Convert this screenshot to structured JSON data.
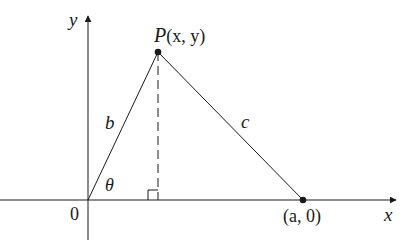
{
  "diagram": {
    "axes": {
      "x_label": "x",
      "y_label": "y",
      "origin_label": "0"
    },
    "points": {
      "P": {
        "label_name": "P",
        "label_coords": "(x, y)"
      },
      "A": {
        "label": "(a, 0)"
      }
    },
    "sides": {
      "b": "b",
      "c": "c"
    },
    "angle_label": "θ",
    "colors": {
      "stroke": "#1a1a1a",
      "background": "#ffffff"
    }
  }
}
